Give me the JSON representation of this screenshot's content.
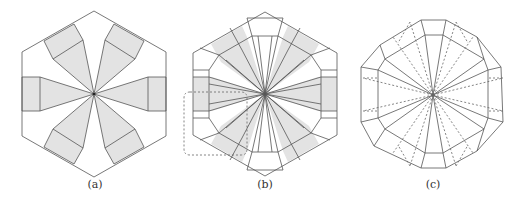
{
  "figure": {
    "panels": [
      {
        "id": "a",
        "label": "(a)",
        "description": "Hexagon with six shaded radial flaps (crease pattern)"
      },
      {
        "id": "b",
        "label": "(b)",
        "description": "Hexagon with shaded flaps and pleats, dashed rounded region highlighted at lower left"
      },
      {
        "id": "c",
        "label": "(c)",
        "description": "Dodecagon-like folded form with solid and dashed crease lines"
      }
    ],
    "colors": {
      "line": "#555555",
      "fill": "#e3e3e3",
      "dashed": "#555555",
      "background": "#ffffff"
    }
  }
}
